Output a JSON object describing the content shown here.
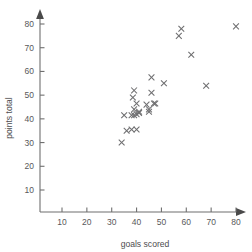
{
  "chart_data": {
    "type": "scatter",
    "title": "",
    "xlabel": "goals scored",
    "ylabel": "points total",
    "xlim": [
      0,
      84
    ],
    "ylim": [
      0,
      86
    ],
    "xticks": [
      10,
      20,
      30,
      40,
      50,
      60,
      70,
      80
    ],
    "yticks": [
      10,
      20,
      30,
      40,
      50,
      60,
      70,
      80
    ],
    "grid": false,
    "legend": null,
    "marker": "x",
    "marker_color": "#6e6e70",
    "points": [
      {
        "x": 34,
        "y": 30
      },
      {
        "x": 36,
        "y": 35
      },
      {
        "x": 38,
        "y": 35.5
      },
      {
        "x": 40,
        "y": 35.5
      },
      {
        "x": 35,
        "y": 41.5
      },
      {
        "x": 38,
        "y": 41.5
      },
      {
        "x": 39,
        "y": 41.5
      },
      {
        "x": 40,
        "y": 42
      },
      {
        "x": 41,
        "y": 42.5
      },
      {
        "x": 41,
        "y": 43
      },
      {
        "x": 39,
        "y": 44
      },
      {
        "x": 40,
        "y": 46.5
      },
      {
        "x": 38.5,
        "y": 49
      },
      {
        "x": 39,
        "y": 52
      },
      {
        "x": 44,
        "y": 46
      },
      {
        "x": 45,
        "y": 43
      },
      {
        "x": 45,
        "y": 44
      },
      {
        "x": 46,
        "y": 51
      },
      {
        "x": 47,
        "y": 46.5
      },
      {
        "x": 47.5,
        "y": 46.5
      },
      {
        "x": 46,
        "y": 57.5
      },
      {
        "x": 51,
        "y": 55
      },
      {
        "x": 57,
        "y": 75
      },
      {
        "x": 58,
        "y": 78
      },
      {
        "x": 62,
        "y": 67
      },
      {
        "x": 68,
        "y": 54
      },
      {
        "x": 80,
        "y": 79
      }
    ]
  },
  "axes": {
    "x_arrow": "arrow-right-icon",
    "y_arrow": "arrow-up-icon"
  }
}
